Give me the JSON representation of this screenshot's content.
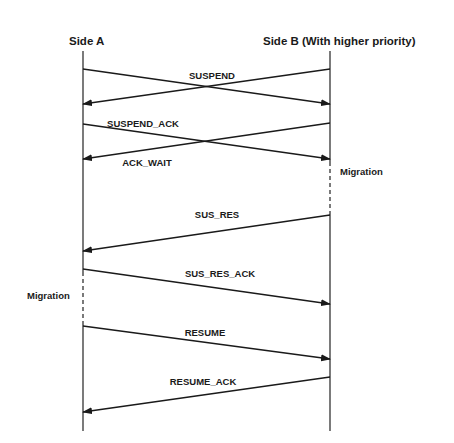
{
  "diagram": {
    "type": "sequence",
    "actors": [
      {
        "id": "A",
        "label": "Side A",
        "x": 83
      },
      {
        "id": "B",
        "label": "Side B (With higher priority)",
        "x": 330
      }
    ],
    "lifeline_top": 51,
    "lifeline_bottom": 431,
    "messages": [
      {
        "label": "SUSPEND",
        "from": "A",
        "to": "B",
        "y_start": 69,
        "y_end": 104,
        "label_x": 212,
        "label_y": 79
      },
      {
        "label": "SUSPEND",
        "from": "B",
        "to": "A",
        "y_start": 69,
        "y_end": 104,
        "label_x": null,
        "label_y": null
      },
      {
        "label": "SUSPEND_ACK",
        "from": "A",
        "to": "B",
        "y_start": 124,
        "y_end": 159,
        "label_x": 143,
        "label_y": 127
      },
      {
        "label": "ACK_WAIT",
        "from": "B",
        "to": "A",
        "y_start": 123,
        "y_end": 159,
        "label_x": 147,
        "label_y": 166
      },
      {
        "label": "SUS_RES",
        "from": "B",
        "to": "A",
        "y_start": 215,
        "y_end": 251,
        "label_x": 217,
        "label_y": 218
      },
      {
        "label": "SUS_RES_ACK",
        "from": "A",
        "to": "B",
        "y_start": 269,
        "y_end": 304,
        "label_x": 220,
        "label_y": 277
      },
      {
        "label": "RESUME",
        "from": "A",
        "to": "B",
        "y_start": 326,
        "y_end": 359,
        "label_x": 205,
        "label_y": 336
      },
      {
        "label": "RESUME_ACK",
        "from": "B",
        "to": "A",
        "y_start": 377,
        "y_end": 412,
        "label_x": 203,
        "label_y": 385
      }
    ],
    "notes": [
      {
        "label": "Migration",
        "side": "B",
        "x": 340,
        "y": 175,
        "dash_from": 162,
        "dash_to": 214
      },
      {
        "label": "Migration",
        "side": "A",
        "x": 27,
        "y": 299,
        "dash_from": 272,
        "dash_to": 325
      }
    ]
  },
  "labels": {
    "side_a": "Side A",
    "side_b": "Side B (With higher priority)",
    "suspend": "SUSPEND",
    "suspend_ack": "SUSPEND_ACK",
    "ack_wait": "ACK_WAIT",
    "sus_res": "SUS_RES",
    "sus_res_ack": "SUS_RES_ACK",
    "resume": "RESUME",
    "resume_ack": "RESUME_ACK",
    "migration_b": "Migration",
    "migration_a": "Migration"
  }
}
